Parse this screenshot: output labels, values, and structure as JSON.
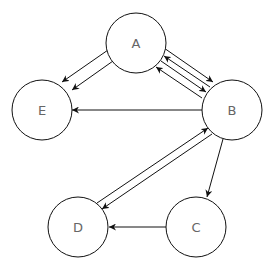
{
  "diagram": {
    "type": "directed-graph",
    "colors": {
      "stroke": "#111111",
      "label": "#666666",
      "fill": "#ffffff"
    },
    "nodes": [
      {
        "id": "A",
        "label": "A",
        "x": 136,
        "y": 43,
        "r": 30
      },
      {
        "id": "B",
        "label": "B",
        "x": 232,
        "y": 110,
        "r": 30
      },
      {
        "id": "E",
        "label": "E",
        "x": 42,
        "y": 110,
        "r": 30
      },
      {
        "id": "D",
        "label": "D",
        "x": 78,
        "y": 227,
        "r": 30
      },
      {
        "id": "C",
        "label": "C",
        "x": 196,
        "y": 227,
        "r": 30
      }
    ],
    "edges": [
      {
        "from": "A",
        "to": "E",
        "count": 2
      },
      {
        "from": "A",
        "to": "B",
        "count": 2
      },
      {
        "from": "B",
        "to": "A",
        "count": 2
      },
      {
        "from": "B",
        "to": "E",
        "count": 1
      },
      {
        "from": "B",
        "to": "D",
        "count": 1
      },
      {
        "from": "D",
        "to": "B",
        "count": 1
      },
      {
        "from": "B",
        "to": "C",
        "count": 1
      },
      {
        "from": "C",
        "to": "D",
        "count": 1
      }
    ]
  }
}
